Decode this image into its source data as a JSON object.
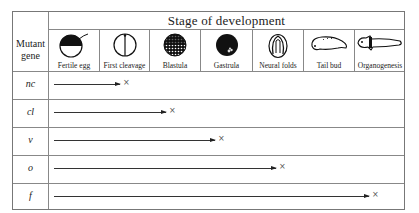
{
  "table": {
    "title": "Stage of development",
    "row_header": "Mutant gene",
    "stages": [
      {
        "label": "Fertile egg",
        "icon": "fertile-egg-icon"
      },
      {
        "label": "First cleavage",
        "icon": "first-cleavage-icon"
      },
      {
        "label": "Blastula",
        "icon": "blastula-icon"
      },
      {
        "label": "Gastrula",
        "icon": "gastrula-icon"
      },
      {
        "label": "Neural folds",
        "icon": "neural-folds-icon"
      },
      {
        "label": "Tail bud",
        "icon": "tail-bud-icon"
      },
      {
        "label": "Organogenesis",
        "icon": "organogenesis-icon"
      }
    ],
    "rows": [
      {
        "gene": "nc",
        "arrest_marker": "×",
        "arrest_after_stage": "First cleavage"
      },
      {
        "gene": "cl",
        "arrest_marker": "×",
        "arrest_after_stage": "Blastula"
      },
      {
        "gene": "v",
        "arrest_marker": "×",
        "arrest_after_stage": "Gastrula"
      },
      {
        "gene": "o",
        "arrest_marker": "×",
        "arrest_after_stage": "Neural folds"
      },
      {
        "gene": "f",
        "arrest_marker": "×",
        "arrest_after_stage": "Organogenesis"
      }
    ]
  }
}
